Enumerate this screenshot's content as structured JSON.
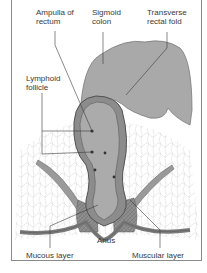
{
  "diagram": {
    "labels": {
      "ampulla": "Ampulla of\nrectum",
      "sigmoid": "Sigmoid\ncolon",
      "transverse": "Transverse\nrectal fold",
      "lymphoid": "Lymphoid\nfollicle",
      "anus": "Anus",
      "mucous": "Mucous layer",
      "muscular": "Muscular layer"
    },
    "colors": {
      "tissue": "#a9a9a9",
      "wall": "#8c8c8c",
      "line": "#3a3a3a",
      "border": "#8a8a8a",
      "background": "#ffffff"
    }
  }
}
